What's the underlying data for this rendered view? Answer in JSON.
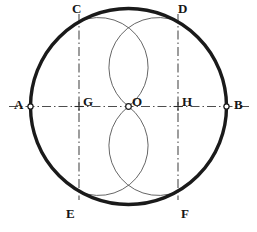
{
  "figure": {
    "background_color": "#ffffff",
    "stroke_color": "#1a1a1a",
    "construction_line_color": "#555555",
    "arc_color": "#4a4a4a"
  },
  "geometry": {
    "circle": {
      "center_x": 128.5,
      "center_y": 106.5,
      "radius": 98,
      "stroke_width": 3.4
    },
    "arcs": [
      {
        "name": "arc-C-O-E",
        "center_x": 79.0,
        "center_y": 106.5,
        "radius": 49.5,
        "from": "C",
        "through": "O",
        "to": "E"
      },
      {
        "name": "arc-D-O-F",
        "center_x": 178.0,
        "center_y": 106.5,
        "radius": 49.5,
        "from": "D",
        "through": "O",
        "to": "F"
      }
    ],
    "construction_lines": [
      {
        "name": "horizontal-diameter-AB",
        "x1": 9,
        "y1": 106.5,
        "x2": 250,
        "y2": 106.5
      },
      {
        "name": "vertical-line-through-G",
        "x1": 79,
        "y1": 14,
        "x2": 79,
        "y2": 200
      },
      {
        "name": "vertical-line-through-H",
        "x1": 178,
        "y1": 14,
        "x2": 178,
        "y2": 200
      }
    ]
  },
  "points": [
    {
      "id": "A",
      "label": "A",
      "x": 30.5,
      "y": 106.5,
      "marker": "open-circle",
      "label_x": 14,
      "label_y": 98
    },
    {
      "id": "B",
      "label": "B",
      "x": 226.5,
      "y": 106.5,
      "marker": "open-circle",
      "label_x": 234,
      "label_y": 98
    },
    {
      "id": "C",
      "label": "C",
      "x": 79.0,
      "y": 21.6,
      "marker": "none",
      "label_x": 72,
      "label_y": 2
    },
    {
      "id": "D",
      "label": "D",
      "x": 178.0,
      "y": 21.6,
      "marker": "none",
      "label_x": 178,
      "label_y": 2
    },
    {
      "id": "E",
      "label": "E",
      "x": 79.0,
      "y": 191.4,
      "marker": "none",
      "label_x": 66,
      "label_y": 207
    },
    {
      "id": "F",
      "label": "F",
      "x": 178.0,
      "y": 191.4,
      "marker": "none",
      "label_x": 181,
      "label_y": 207
    },
    {
      "id": "G",
      "label": "G",
      "x": 79.0,
      "y": 106.5,
      "marker": "cross",
      "label_x": 83,
      "label_y": 95
    },
    {
      "id": "H",
      "label": "H",
      "x": 178.0,
      "y": 106.5,
      "marker": "cross",
      "label_x": 182,
      "label_y": 95
    },
    {
      "id": "O",
      "label": "O",
      "x": 128.5,
      "y": 106.5,
      "marker": "open-circle",
      "label_x": 132,
      "label_y": 95
    }
  ]
}
